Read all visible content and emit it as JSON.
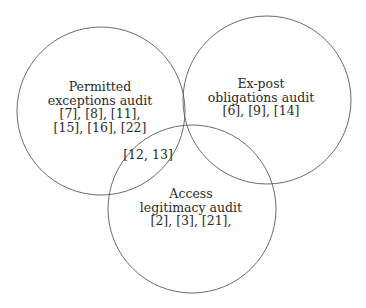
{
  "diagram": {
    "type": "venn",
    "colors": {
      "stroke": "#5a5a5a",
      "text": "#2a2a2a",
      "background": "#ffffff"
    },
    "sets": [
      {
        "id": "permitted",
        "title_lines": [
          "Permitted",
          "exceptions audit"
        ],
        "refs_lines": [
          "[7], [8], [11],",
          "[15], [16], [22]"
        ],
        "circle": {
          "cx": 101,
          "cy": 111,
          "r": 84
        }
      },
      {
        "id": "expost",
        "title_lines": [
          "Ex-post",
          "obligations audit"
        ],
        "refs_lines": [
          "[6], [9], [14]"
        ],
        "circle": {
          "cx": 267,
          "cy": 100,
          "r": 84
        }
      },
      {
        "id": "access",
        "title_lines": [
          "Access",
          "legitimacy audit"
        ],
        "refs_lines": [
          "[2], [3], [21],"
        ],
        "circle": {
          "cx": 192,
          "cy": 209,
          "r": 84
        }
      }
    ],
    "intersections": [
      {
        "sets": [
          "permitted",
          "access"
        ],
        "label": "[12, 13]"
      }
    ]
  }
}
